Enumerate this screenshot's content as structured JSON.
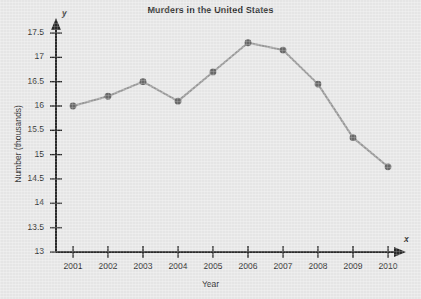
{
  "chart_data": {
    "type": "line",
    "title": "Murders in the United States",
    "xlabel": "Year",
    "ylabel": "Number (thousands)",
    "x_axis_name": "x",
    "y_axis_name": "y",
    "categories": [
      "2001",
      "2002",
      "2003",
      "2004",
      "2005",
      "2006",
      "2007",
      "2008",
      "2009",
      "2010"
    ],
    "values": [
      16.0,
      16.2,
      16.5,
      16.1,
      16.7,
      17.3,
      17.15,
      16.45,
      15.35,
      14.75
    ],
    "x": [
      2001,
      2002,
      2003,
      2004,
      2005,
      2006,
      2007,
      2008,
      2009,
      2010
    ],
    "xlim": [
      2000.5,
      2010.5
    ],
    "ylim": [
      13,
      17.5
    ],
    "y_ticks": [
      "13",
      "13.5",
      "14",
      "14.5",
      "15",
      "15.5",
      "16",
      "16.5",
      "17",
      "17.5"
    ],
    "y_tick_values": [
      13,
      13.5,
      14,
      14.5,
      15,
      15.5,
      16,
      16.5,
      17,
      17.5
    ],
    "grid": false,
    "legend": null,
    "marker": "circle",
    "line_color": "#9a9a9a",
    "marker_color": "#6a6a6a",
    "axis_color": "#2b2b2b",
    "background_color": "#e9e9e9"
  },
  "watermark": {
    "text": ""
  }
}
